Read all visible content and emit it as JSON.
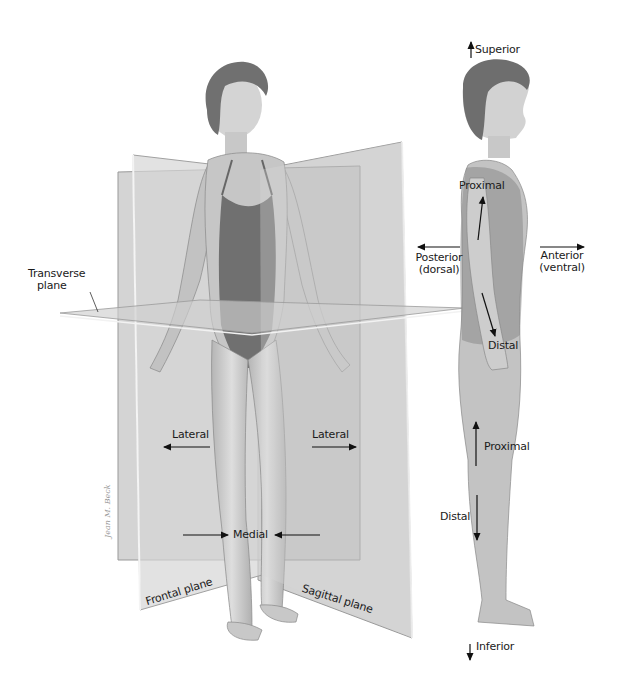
{
  "diagram": {
    "colors": {
      "background": "#ffffff",
      "plane_fill": "#bdbdbd",
      "plane_edge": "#e6e6e6",
      "skin": "#cfcfcf",
      "swimsuit": "#6e6e6e",
      "hair": "#6a6a6a",
      "text": "#1a1a1a",
      "arrow": "#111111"
    },
    "planes": {
      "transverse": {
        "label_line1": "Transverse",
        "label_line2": "plane"
      },
      "frontal": {
        "label": "Frontal plane"
      },
      "sagittal": {
        "label": "Sagittal plane"
      }
    },
    "front_figure_labels": {
      "lateral_left": "Lateral",
      "lateral_right": "Lateral",
      "medial": "Medial"
    },
    "side_figure_labels": {
      "superior": "Superior",
      "inferior": "Inferior",
      "posterior_line1": "Posterior",
      "posterior_line2": "(dorsal)",
      "anterior_line1": "Anterior",
      "anterior_line2": "(ventral)",
      "proximal_arm": "Proximal",
      "distal_arm": "Distal",
      "proximal_leg": "Proximal",
      "distal_leg": "Distal"
    },
    "signature": "Jean M. Beck"
  }
}
